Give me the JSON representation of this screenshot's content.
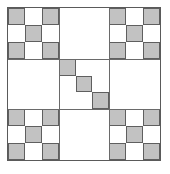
{
  "figure": {
    "type": "fractal-grid",
    "grid_columns": 9,
    "grid_rows": 9,
    "caption": "",
    "colors": {
      "filled": "#c2c2c2",
      "empty": "#ffffff",
      "line": "#5f5f5f",
      "frame": "#5a5a5a",
      "background": "#ffffff"
    },
    "legend": {
      "filled_label": "filled cell",
      "empty_label": "empty cell"
    }
  },
  "chart_data": {
    "type": "heatmap",
    "xlabel": "",
    "ylabel": "",
    "categories": [
      "1",
      "2",
      "3",
      "4",
      "5",
      "6",
      "7",
      "8",
      "9"
    ],
    "rows": [
      "1",
      "2",
      "3",
      "4",
      "5",
      "6",
      "7",
      "8",
      "9"
    ],
    "grid": true,
    "legend": "none",
    "values": [
      [
        1,
        0,
        1,
        0,
        0,
        0,
        1,
        0,
        1
      ],
      [
        0,
        1,
        0,
        0,
        0,
        0,
        0,
        1,
        0
      ],
      [
        1,
        0,
        1,
        0,
        0,
        0,
        1,
        0,
        1
      ],
      [
        0,
        0,
        0,
        1,
        0,
        0,
        0,
        0,
        0
      ],
      [
        0,
        0,
        0,
        0,
        1,
        0,
        0,
        0,
        0
      ],
      [
        0,
        0,
        0,
        0,
        0,
        1,
        0,
        0,
        0
      ],
      [
        1,
        0,
        1,
        0,
        0,
        0,
        1,
        0,
        1
      ],
      [
        0,
        1,
        0,
        0,
        0,
        0,
        0,
        1,
        0
      ],
      [
        1,
        0,
        1,
        0,
        0,
        0,
        1,
        0,
        1
      ]
    ]
  }
}
